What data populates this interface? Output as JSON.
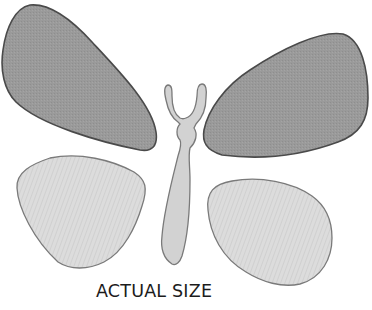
{
  "figure": {
    "caption": "ACTUAL SIZE",
    "parts": [
      {
        "id": "upper-left-wing",
        "label": "Upper left wing",
        "fill": "#9a9a9a",
        "stroke": "#4a4a4a"
      },
      {
        "id": "upper-right-wing",
        "label": "Upper right wing",
        "fill": "#9a9a9a",
        "stroke": "#4a4a4a"
      },
      {
        "id": "lower-left-wing",
        "label": "Lower left wing",
        "fill": "#dadada",
        "stroke": "#7a7a7a"
      },
      {
        "id": "lower-right-wing",
        "label": "Lower right wing",
        "fill": "#dadada",
        "stroke": "#7a7a7a"
      },
      {
        "id": "body",
        "label": "Body with antennae",
        "fill": "#d2d2d2",
        "stroke": "#7a7a7a"
      }
    ]
  },
  "colors": {
    "background": "#ffffff",
    "upper_wing_fill": "#9a9a9a",
    "upper_wing_stroke": "#4a4a4a",
    "lower_wing_fill": "#dadada",
    "lower_wing_stroke": "#7a7a7a",
    "body_fill": "#d2d2d2",
    "caption_text": "#1c1c1c"
  }
}
